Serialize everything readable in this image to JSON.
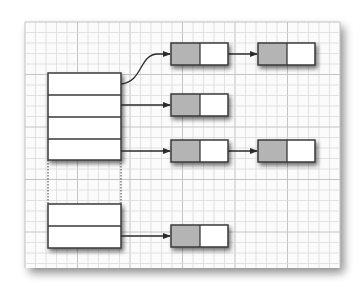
{
  "diagram": {
    "type": "hash-table-with-separate-chaining",
    "canvas": {
      "width": 361,
      "height": 295
    },
    "colors": {
      "background": "#ffffff",
      "paper": "#fbfbfb",
      "grid_minor": "#dcdcdc",
      "grid_major": "#c4c4c4",
      "outline": "#3a3a3a",
      "node_key_fill": "#b4b4b4",
      "node_next_fill": "#ffffff",
      "arrow": "#2a2a2a",
      "shadow": "#000000"
    },
    "paper": {
      "x": 25,
      "y": 22,
      "width": 315,
      "height": 246,
      "grid_step": 10.5,
      "major_every": 5
    },
    "bucket_array": {
      "x": 48,
      "width": 73,
      "groups": [
        {
          "y": 73,
          "row_heights": [
            22,
            22,
            22,
            21
          ],
          "label": "top-buckets"
        },
        {
          "y": 204,
          "row_heights": [
            22,
            22
          ],
          "label": "bottom-buckets"
        }
      ],
      "ellipsis_gap": {
        "y1": 160,
        "y2": 204,
        "style": "dotted"
      }
    },
    "chains": [
      {
        "bucket_row": 0,
        "source": {
          "x": 121,
          "y": 84
        },
        "curved": true,
        "nodes": [
          {
            "x": 171,
            "y": 43
          },
          {
            "x": 258,
            "y": 43
          }
        ]
      },
      {
        "bucket_row": 1,
        "source": {
          "x": 121,
          "y": 106
        },
        "curved": false,
        "nodes": [
          {
            "x": 171,
            "y": 94
          }
        ]
      },
      {
        "bucket_row": 3,
        "source": {
          "x": 121,
          "y": 151
        },
        "curved": false,
        "nodes": [
          {
            "x": 171,
            "y": 140
          },
          {
            "x": 258,
            "y": 140
          }
        ]
      },
      {
        "bucket_row": 5,
        "source": {
          "x": 121,
          "y": 237
        },
        "curved": false,
        "nodes": [
          {
            "x": 171,
            "y": 225
          }
        ]
      }
    ],
    "node_size": {
      "width": 57,
      "height": 22,
      "key_width": 29
    }
  }
}
